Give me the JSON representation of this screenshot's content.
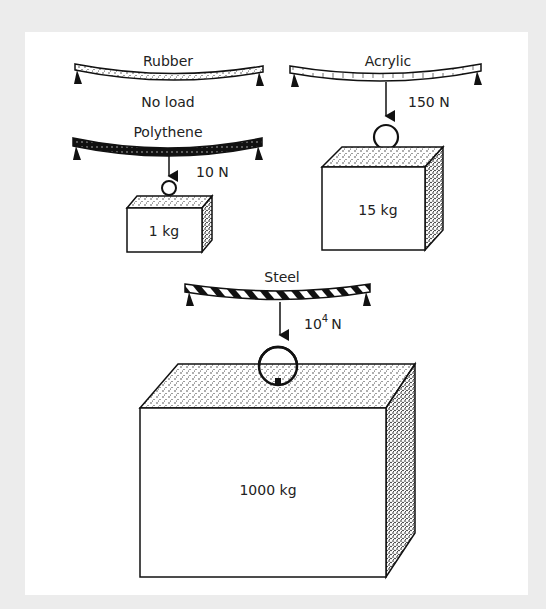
{
  "figure": {
    "colors": {
      "frame": "#ececec",
      "panel": "#ffffff",
      "ink": "#1a1a1a"
    },
    "beams": [
      {
        "material": "Rubber",
        "caption": "No load",
        "force": "",
        "mass": ""
      },
      {
        "material": "Polythene",
        "caption": "",
        "force": "10 N",
        "mass": "1 kg"
      },
      {
        "material": "Acrylic",
        "caption": "",
        "force": "150 N",
        "mass": "15 kg"
      },
      {
        "material": "Steel",
        "caption": "",
        "force_base": "10",
        "force_exp": "4",
        "force_unit": "N",
        "mass": "1000 kg"
      }
    ]
  }
}
